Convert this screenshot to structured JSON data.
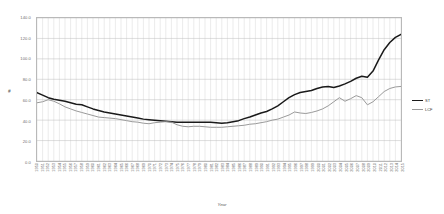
{
  "chart_data": {
    "type": "line",
    "title": "",
    "xlabel": "Year",
    "ylabel": "#",
    "ylim": [
      0.0,
      140.0
    ],
    "grid": true,
    "legend_position": "right",
    "y_ticks": [
      "140.0",
      "120.0",
      "100.0",
      "80.0",
      "60.0",
      "40.0",
      "20.0",
      "0.0"
    ],
    "y_tick_values": [
      140.0,
      120.0,
      100.0,
      80.0,
      60.0,
      40.0,
      20.0,
      0.0
    ],
    "categories": [
      "1950",
      "1951",
      "1952",
      "1953",
      "1954",
      "1955",
      "1956",
      "1957",
      "1958",
      "1959",
      "1960",
      "1961",
      "1962",
      "1963",
      "1964",
      "1965",
      "1966",
      "1967",
      "1968",
      "1969",
      "1970",
      "1971",
      "1972",
      "1973",
      "1974",
      "1975",
      "1976",
      "1977",
      "1978",
      "1979",
      "1980",
      "1981",
      "1982",
      "1983",
      "1984",
      "1985",
      "1986",
      "1987",
      "1988",
      "1989",
      "1990",
      "1991",
      "1992",
      "1993",
      "1994",
      "1995",
      "1996",
      "1997",
      "1998",
      "1999",
      "2000",
      "2001",
      "2002",
      "2003",
      "2004",
      "2005",
      "2006",
      "2007",
      "2008",
      "2009",
      "2010",
      "2011",
      "2012",
      "2013",
      "2014",
      "2015"
    ],
    "series": [
      {
        "name": "ST",
        "color": "#1a1a1a",
        "width": 1.5,
        "values": [
          67.0,
          64.5,
          62.0,
          60.5,
          59.5,
          58.5,
          57.0,
          55.5,
          55.0,
          53.0,
          51.0,
          49.5,
          48.0,
          47.0,
          46.0,
          45.0,
          44.0,
          43.0,
          42.0,
          41.0,
          40.5,
          40.0,
          39.5,
          39.0,
          38.5,
          38.0,
          38.0,
          38.0,
          38.0,
          38.0,
          38.0,
          38.0,
          37.5,
          37.0,
          37.5,
          38.5,
          39.5,
          41.5,
          43.0,
          45.0,
          47.0,
          48.5,
          51.0,
          54.0,
          58.0,
          62.0,
          65.0,
          67.0,
          68.0,
          69.0,
          71.0,
          72.5,
          73.0,
          72.0,
          73.5,
          75.5,
          78.0,
          81.0,
          83.0,
          82.0,
          88.0,
          99.0,
          109.0,
          116.0,
          121.0,
          124.0
        ]
      },
      {
        "name": "LCF",
        "color": "#9a9a9a",
        "width": 1.0,
        "values": [
          57.0,
          58.0,
          60.0,
          58.5,
          56.0,
          53.0,
          51.0,
          49.0,
          47.5,
          46.0,
          44.5,
          43.0,
          42.5,
          42.0,
          41.5,
          40.5,
          39.5,
          38.5,
          38.0,
          37.0,
          36.5,
          37.5,
          38.0,
          38.5,
          38.0,
          35.5,
          34.0,
          33.5,
          34.0,
          34.0,
          33.5,
          33.0,
          33.0,
          33.0,
          33.5,
          34.0,
          34.5,
          35.0,
          36.0,
          36.5,
          37.5,
          38.5,
          40.0,
          41.0,
          43.0,
          45.0,
          48.0,
          47.0,
          46.5,
          47.5,
          49.0,
          51.0,
          54.0,
          58.0,
          62.0,
          58.5,
          61.0,
          64.0,
          62.0,
          55.0,
          58.0,
          63.0,
          68.0,
          71.0,
          72.5,
          73.0
        ]
      }
    ]
  },
  "legend": {
    "items": [
      {
        "label": "ST",
        "color": "#1a1a1a"
      },
      {
        "label": "LCF",
        "color": "#9a9a9a"
      }
    ]
  }
}
